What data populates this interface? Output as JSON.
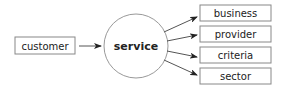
{
  "diagram": {
    "source": {
      "label": "customer",
      "x": 15,
      "y": 37,
      "w": 60,
      "h": 17
    },
    "center": {
      "label": "service",
      "cx": 136,
      "cy": 46,
      "r": 32
    },
    "targets": [
      {
        "label": "business",
        "x": 200,
        "y": 5,
        "w": 71,
        "h": 16
      },
      {
        "label": "provider",
        "x": 200,
        "y": 26,
        "w": 71,
        "h": 16
      },
      {
        "label": "criteria",
        "x": 200,
        "y": 47,
        "w": 71,
        "h": 16
      },
      {
        "label": "sector",
        "x": 200,
        "y": 68,
        "w": 71,
        "h": 16
      }
    ],
    "colors": {
      "stroke": "#888888",
      "arrow": "#222222",
      "text": "#222222"
    }
  }
}
